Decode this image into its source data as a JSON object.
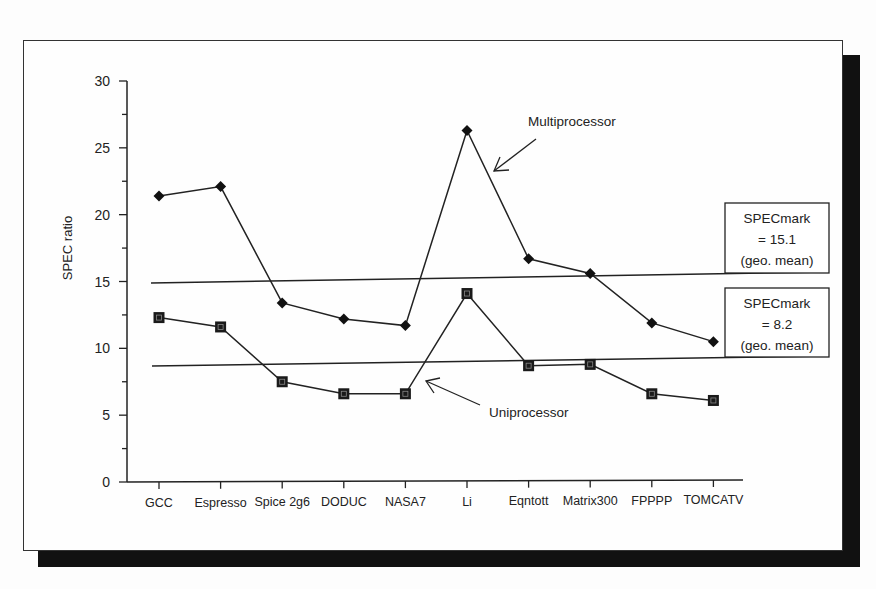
{
  "chart_data": {
    "type": "line",
    "title": "",
    "xlabel": "",
    "ylabel": "SPEC ratio",
    "ylim": [
      0,
      30
    ],
    "yticks": [
      0,
      5,
      10,
      15,
      20,
      25,
      30
    ],
    "grid": false,
    "legend_position": "inline-annotations",
    "categories": [
      "GCC",
      "Espresso",
      "Spice 2g6",
      "DODUC",
      "NASA7",
      "Li",
      "Eqntott",
      "Matrix300",
      "FPPPP",
      "TOMCATV"
    ],
    "series": [
      {
        "name": "Multiprocessor",
        "marker": "diamond",
        "values": [
          21.4,
          22.1,
          13.4,
          12.2,
          11.7,
          26.3,
          16.7,
          15.6,
          11.9,
          10.5
        ]
      },
      {
        "name": "Uniprocessor",
        "marker": "square",
        "values": [
          12.3,
          11.6,
          7.5,
          6.6,
          6.6,
          14.1,
          8.7,
          8.8,
          6.6,
          6.1
        ]
      }
    ],
    "reference_lines": [
      {
        "label": "SPECmark = 15.1 (geo. mean)",
        "value": 15.1
      },
      {
        "label": "SPECmark = 8.2 (geo. mean)",
        "value": 8.2
      }
    ],
    "annotations": [
      {
        "text": "Multiprocessor",
        "points_to": "Multiprocessor series near Li"
      },
      {
        "text": "Uniprocessor",
        "points_to": "Uniprocessor series near NASA7"
      }
    ]
  },
  "labels": {
    "ylabel": "SPEC ratio",
    "multi_annotation": "Multiprocessor",
    "uni_annotation": "Uniprocessor",
    "box1": {
      "line1": "SPECmark",
      "line2": "= 15.1",
      "line3": "(geo. mean)"
    },
    "box2": {
      "line1": "SPECmark",
      "line2": "= 8.2",
      "line3": "(geo. mean)"
    }
  }
}
